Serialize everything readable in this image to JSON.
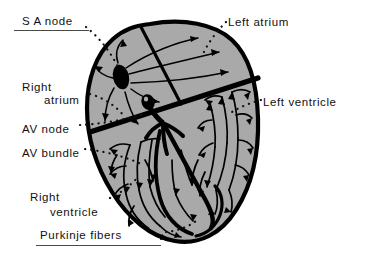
{
  "figure": {
    "background_color": "#ffffff",
    "ink_color": "#111111",
    "myocardium_fill": "#a9a9a9",
    "outline_color": "#000000"
  },
  "labels": [
    {
      "id": "sa-node",
      "text": "S A node",
      "x": 22,
      "y": 14,
      "underline": true,
      "underline_x": 14,
      "underline_y": 30,
      "underline_w": 75
    },
    {
      "id": "left-atrium",
      "text": "Left atrium",
      "x": 228,
      "y": 15,
      "underline": false,
      "underline_x": 0,
      "underline_y": 0,
      "underline_w": 0
    },
    {
      "id": "right-atrium-1",
      "text": "Right",
      "x": 22,
      "y": 80,
      "underline": false,
      "underline_x": 0,
      "underline_y": 0,
      "underline_w": 0
    },
    {
      "id": "right-atrium-2",
      "text": "atrium",
      "x": 44,
      "y": 93,
      "underline": false,
      "underline_x": 0,
      "underline_y": 0,
      "underline_w": 0
    },
    {
      "id": "left-ventricle",
      "text": "Left ventricle",
      "x": 263,
      "y": 95,
      "underline": false,
      "underline_x": 0,
      "underline_y": 0,
      "underline_w": 0
    },
    {
      "id": "av-node",
      "text": "AV node",
      "x": 22,
      "y": 122,
      "underline": false,
      "underline_x": 0,
      "underline_y": 0,
      "underline_w": 0
    },
    {
      "id": "av-bundle",
      "text": "AV bundle",
      "x": 22,
      "y": 146,
      "underline": false,
      "underline_x": 0,
      "underline_y": 0,
      "underline_w": 0
    },
    {
      "id": "right-ventricle-1",
      "text": "Right",
      "x": 30,
      "y": 190,
      "underline": false,
      "underline_x": 0,
      "underline_y": 0,
      "underline_w": 0
    },
    {
      "id": "right-ventricle-2",
      "text": "ventricle",
      "x": 50,
      "y": 205,
      "underline": false,
      "underline_x": 0,
      "underline_y": 0,
      "underline_w": 0
    },
    {
      "id": "purkinje-fibers",
      "text": "Purkinje  fibers",
      "x": 40,
      "y": 228,
      "underline": true,
      "underline_x": 36,
      "underline_y": 245,
      "underline_w": 125
    }
  ],
  "structures": [
    {
      "id": "sa-node-marker",
      "name": "SA node"
    },
    {
      "id": "av-node-marker",
      "name": "AV node"
    },
    {
      "id": "av-bundle-path",
      "name": "AV bundle"
    },
    {
      "id": "purkinje-network",
      "name": "Purkinje fibers"
    },
    {
      "id": "interatrial-septum-line",
      "name": "Interatrial septum"
    },
    {
      "id": "av-groove-band",
      "name": "Atrioventricular groove"
    },
    {
      "id": "heart-outline",
      "name": "Heart outline"
    }
  ]
}
